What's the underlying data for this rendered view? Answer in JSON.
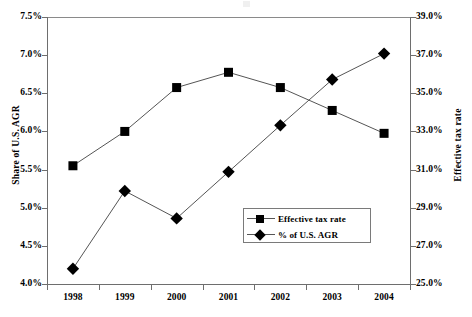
{
  "chart_data": {
    "type": "line",
    "title": "",
    "xlabel": "",
    "categories": [
      "1998",
      "1999",
      "2000",
      "2001",
      "2002",
      "2003",
      "2004"
    ],
    "grid": false,
    "legend_position": "inside-center-bottom",
    "axes": {
      "left": {
        "label": "Share of U.S. AGR",
        "ticks": [
          "4.0%",
          "4.5%",
          "5.0%",
          "5.5%",
          "6.0%",
          "6.5%",
          "7.0%",
          "7.5%"
        ],
        "tick_values": [
          4.0,
          4.5,
          5.0,
          5.5,
          6.0,
          6.5,
          7.0,
          7.5
        ],
        "min": 4.0,
        "max": 7.5,
        "step": 0.5
      },
      "right": {
        "label": "Effective tax rate",
        "ticks": [
          "25.0%",
          "27.0%",
          "29.0%",
          "31.0%",
          "33.0%",
          "35.0%",
          "37.0%",
          "39.0%"
        ],
        "tick_values": [
          25.0,
          27.0,
          29.0,
          31.0,
          33.0,
          35.0,
          37.0,
          39.0
        ],
        "min": 25.0,
        "max": 39.0,
        "step": 2.0
      }
    },
    "series": [
      {
        "name": "Effective tax rate",
        "axis": "right",
        "marker": "square",
        "color": "#000000",
        "values": [
          31.2,
          33.0,
          35.3,
          36.1,
          35.3,
          34.1,
          32.9
        ]
      },
      {
        "name": "% of U.S. AGR",
        "axis": "left",
        "marker": "diamond",
        "color": "#000000",
        "values": [
          4.2,
          5.22,
          4.86,
          5.47,
          6.08,
          6.68,
          7.02
        ]
      }
    ]
  },
  "legend": {
    "items": [
      {
        "label": "Effective tax rate",
        "marker": "square"
      },
      {
        "label": "% of U.S. AGR",
        "marker": "diamond"
      }
    ]
  }
}
